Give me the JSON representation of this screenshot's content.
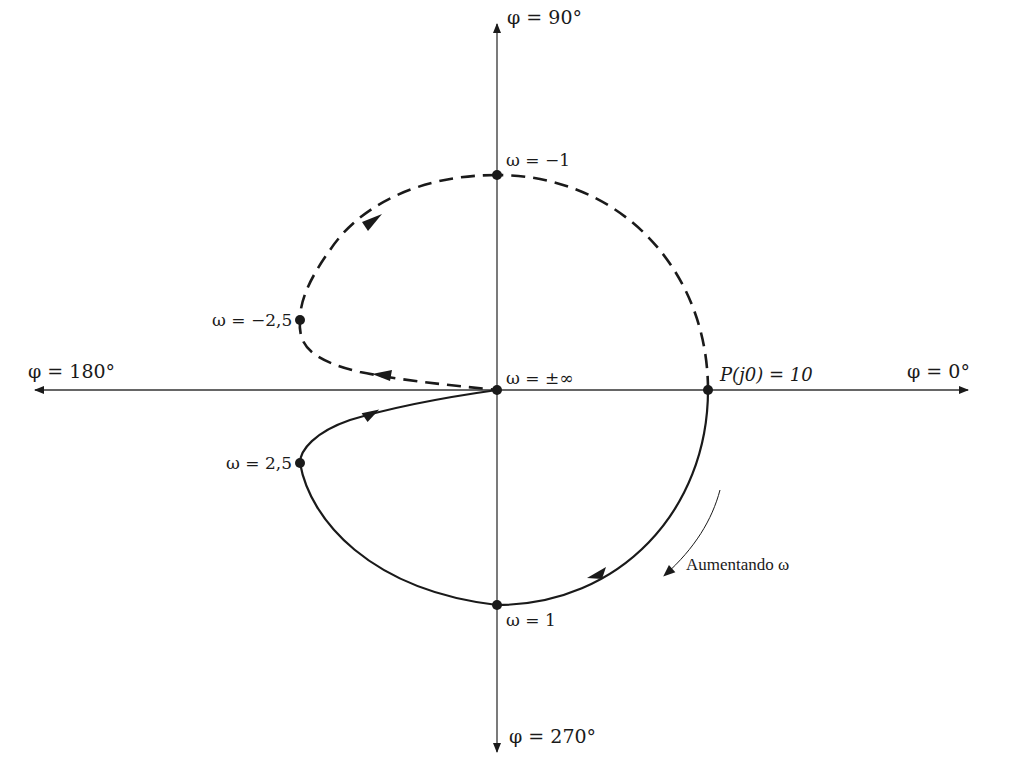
{
  "colors": {
    "ink": "#1a1a1a",
    "axis": "#333333",
    "background": "#ffffff"
  },
  "axes": {
    "top_label": "φ = 90°",
    "bottom_label": "φ = 270°",
    "left_label": "φ = 180°",
    "right_label": "φ = 0°"
  },
  "points": {
    "origin": "ω = ±∞",
    "p_j0": "P(j0) = 10",
    "w_neg1": "ω = −1",
    "w_pos1": "ω = 1",
    "w_neg25": "ω = −2,5",
    "w_pos25": "ω = 2,5"
  },
  "annotation": {
    "increasing_omega": "Aumentando ω"
  },
  "curves": {
    "negative_frequency": {
      "style": "dashed",
      "description": "ω from 0 to −∞"
    },
    "positive_frequency": {
      "style": "solid",
      "description": "ω from 0 to +∞"
    }
  }
}
